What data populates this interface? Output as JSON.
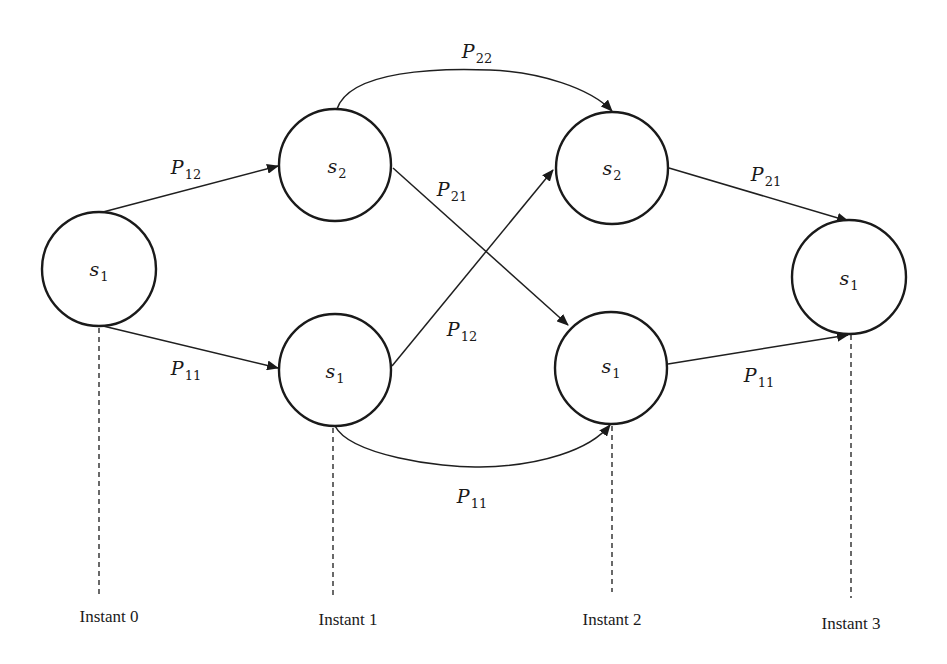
{
  "diagram": {
    "type": "trellis / state transition diagram",
    "instants": [
      {
        "label": "Instant 0",
        "x": 99,
        "y": 619
      },
      {
        "label": "Instant 1",
        "x": 348,
        "y": 622
      },
      {
        "label": "Instant 2",
        "x": 612,
        "y": 622
      },
      {
        "label": "Instant 3",
        "x": 851,
        "y": 625
      }
    ],
    "nodes": [
      {
        "id": "n0_s1",
        "state": "s",
        "sub": "1",
        "instant": 0,
        "cx": 99,
        "cy": 269,
        "r": 57
      },
      {
        "id": "n1_s2",
        "state": "s",
        "sub": "2",
        "instant": 1,
        "cx": 335,
        "cy": 165,
        "r": 56
      },
      {
        "id": "n1_s1",
        "state": "s",
        "sub": "1",
        "instant": 1,
        "cx": 335,
        "cy": 370,
        "r": 56
      },
      {
        "id": "n2_s2",
        "state": "s",
        "sub": "2",
        "instant": 2,
        "cx": 612,
        "cy": 168,
        "r": 56
      },
      {
        "id": "n2_s1",
        "state": "s",
        "sub": "1",
        "instant": 2,
        "cx": 611,
        "cy": 368,
        "r": 56
      },
      {
        "id": "n3_s1",
        "state": "s",
        "sub": "1",
        "instant": 3,
        "cx": 849,
        "cy": 277,
        "r": 57
      }
    ],
    "edges": [
      {
        "from": "n0_s1",
        "to": "n1_s2",
        "label": "P",
        "sub": "12",
        "lx": 180,
        "ly": 163
      },
      {
        "from": "n0_s1",
        "to": "n1_s1",
        "label": "P",
        "sub": "11",
        "lx": 182,
        "ly": 369
      },
      {
        "from": "n1_s2",
        "to": "n2_s2",
        "label": "P",
        "sub": "22",
        "lx": 474,
        "ly": 56,
        "curved": true
      },
      {
        "from": "n1_s2",
        "to": "n2_s1",
        "label": "P",
        "sub": "21",
        "lx": 448,
        "ly": 191
      },
      {
        "from": "n1_s1",
        "to": "n2_s2",
        "label": "P",
        "sub": "12",
        "lx": 457,
        "ly": 331
      },
      {
        "from": "n1_s1",
        "to": "n2_s1",
        "label": "P",
        "sub": "11",
        "lx": 471,
        "ly": 497,
        "curved": true
      },
      {
        "from": "n2_s2",
        "to": "n3_s1",
        "label": "P",
        "sub": "21",
        "lx": 770,
        "ly": 176
      },
      {
        "from": "n2_s1",
        "to": "n3_s1",
        "label": "P",
        "sub": "11",
        "lx": 763,
        "ly": 378
      }
    ]
  },
  "labels": {
    "n0": {
      "state": "s",
      "sub": "1"
    },
    "n1_top": {
      "state": "s",
      "sub": "2"
    },
    "n1_bot": {
      "state": "s",
      "sub": "1"
    },
    "n2_top": {
      "state": "s",
      "sub": "2"
    },
    "n2_bot": {
      "state": "s",
      "sub": "1"
    },
    "n3": {
      "state": "s",
      "sub": "1"
    },
    "e_0_12": {
      "p": "P",
      "sub": "12"
    },
    "e_0_11": {
      "p": "P",
      "sub": "11"
    },
    "e_1_22": {
      "p": "P",
      "sub": "22"
    },
    "e_1_21": {
      "p": "P",
      "sub": "21"
    },
    "e_1_12": {
      "p": "P",
      "sub": "12"
    },
    "e_1_11": {
      "p": "P",
      "sub": "11"
    },
    "e_2_21": {
      "p": "P",
      "sub": "21"
    },
    "e_2_11": {
      "p": "P",
      "sub": "11"
    },
    "instant0": "Instant 0",
    "instant1": "Instant 1",
    "instant2": "Instant 2",
    "instant3": "Instant 3"
  },
  "colors": {
    "background": "#ffffff",
    "stroke": "#1a1a1a"
  }
}
